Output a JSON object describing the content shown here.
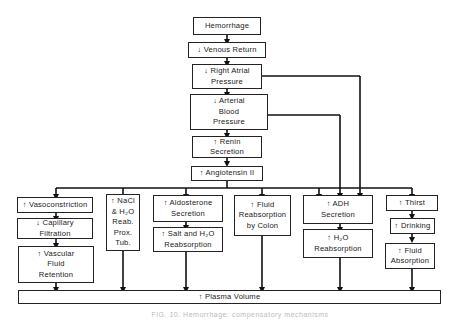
{
  "diagram": {
    "nodes": {
      "hemorrhage": "Hemorrhage",
      "venous_return": "↓ Venous Return",
      "right_atrial": "↓ Right Atrial\nPressure",
      "arterial_bp": "↓ Arterial\nBlood\nPressure",
      "renin": "↑ Renin\nSecretion",
      "angiotensin": "↑ Angiotensin II",
      "vasoconstriction": "↑ Vasoconstriction",
      "capillary": "↓ Capillary\nFiltration",
      "vascular_fluid": "↑ Vascular\nFluid\nRetention",
      "nacl": "↑ NaCl\n& H₂O\nReab.\nProx.\nTub.",
      "aldosterone": "↑ Aldosterone\nSecretion",
      "salt_h2o": "↑ Salt and H₂O\nReabsorption",
      "colon": "↑ Fluid\nReabsorption\nby Colon",
      "adh": "↑ ADH\nSecretion",
      "h2o_reab": "↑ H₂O\nReabsorption",
      "thirst": "↑ Thirst",
      "drinking": "↑ Drinking",
      "fluid_absorption": "↑ Fluid\nAbsorption",
      "plasma_volume": "↑ Plasma Volume"
    },
    "caption": "FIG. 10. Hemorrhage: compensatory mechanisms"
  }
}
